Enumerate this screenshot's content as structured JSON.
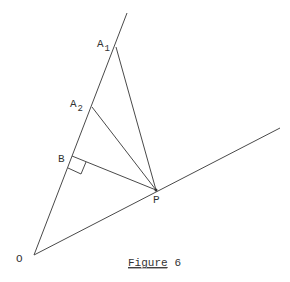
{
  "figure": {
    "caption_word": "Figure",
    "caption_number": "6",
    "caption_word_underlined": true
  },
  "points": {
    "O": {
      "label": "O"
    },
    "A1": {
      "label": "A",
      "subscript": "1"
    },
    "A2": {
      "label": "A",
      "subscript": "2"
    },
    "B": {
      "label": "B"
    },
    "P": {
      "label": "P"
    }
  },
  "segments": [
    {
      "from": "O",
      "to": "upper-ray-end",
      "name": "upper-ray"
    },
    {
      "from": "O",
      "to": "lower-ray-end",
      "name": "lower-ray"
    },
    {
      "from": "A1",
      "to": "P",
      "name": "segment-a1-p"
    },
    {
      "from": "A2",
      "to": "P",
      "name": "segment-a2-p"
    },
    {
      "from": "B",
      "to": "P",
      "name": "segment-b-p"
    }
  ],
  "right_angle_at": "B",
  "colors": {
    "line": "#4a4a4a",
    "text": "#333333",
    "background": "#ffffff"
  }
}
